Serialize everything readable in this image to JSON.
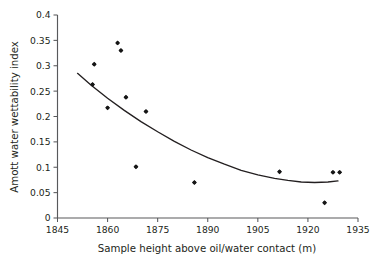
{
  "chart_data": {
    "type": "scatter",
    "title": "",
    "xlabel": "Sample height above oil/water contact (m)",
    "ylabel": "Amott water wettability index",
    "xlim": [
      1845,
      1935
    ],
    "ylim": [
      0,
      0.4
    ],
    "xticks": [
      1845,
      1860,
      1875,
      1890,
      1905,
      1920,
      1935
    ],
    "xtick_labels": [
      "1845",
      "1860",
      "1875",
      "1890",
      "1905",
      "1920",
      "1935"
    ],
    "yticks": [
      0,
      0.05,
      0.1,
      0.15,
      0.2,
      0.25,
      0.3,
      0.35,
      0.4
    ],
    "ytick_labels": [
      "0",
      "0.05",
      "0.1",
      "0.15",
      "0.2",
      "0.25",
      "0.3",
      "0.35",
      "0.4"
    ],
    "grid": false,
    "legend": null,
    "marker": "filled-diamond",
    "marker_color": "#161616",
    "points": [
      {
        "x": 1856.0,
        "y": 0.303
      },
      {
        "x": 1855.5,
        "y": 0.263
      },
      {
        "x": 1863.0,
        "y": 0.345
      },
      {
        "x": 1864.0,
        "y": 0.33
      },
      {
        "x": 1860.0,
        "y": 0.217
      },
      {
        "x": 1865.5,
        "y": 0.238
      },
      {
        "x": 1871.5,
        "y": 0.21
      },
      {
        "x": 1868.5,
        "y": 0.101
      },
      {
        "x": 1886.0,
        "y": 0.07
      },
      {
        "x": 1911.5,
        "y": 0.091
      },
      {
        "x": 1925.0,
        "y": 0.03
      },
      {
        "x": 1927.5,
        "y": 0.09
      },
      {
        "x": 1929.5,
        "y": 0.09
      }
    ],
    "series": [
      {
        "name": "Amott index data",
        "x": [
          1856.0,
          1855.5,
          1863.0,
          1864.0,
          1860.0,
          1865.5,
          1871.5,
          1868.5,
          1886.0,
          1911.5,
          1925.0,
          1927.5,
          1929.5
        ],
        "values": [
          0.303,
          0.263,
          0.345,
          0.33,
          0.217,
          0.238,
          0.21,
          0.101,
          0.07,
          0.091,
          0.03,
          0.09,
          0.09
        ]
      }
    ],
    "trendline": {
      "name": "polynomial-fit",
      "color": "#231f20",
      "x": [
        1851,
        1855,
        1860,
        1865,
        1870,
        1875,
        1880,
        1885,
        1890,
        1895,
        1900,
        1905,
        1910,
        1914,
        1918,
        1922,
        1926,
        1929
      ],
      "y": [
        0.285,
        0.262,
        0.236,
        0.212,
        0.19,
        0.17,
        0.151,
        0.134,
        0.119,
        0.106,
        0.094,
        0.085,
        0.078,
        0.074,
        0.071,
        0.07,
        0.071,
        0.073
      ]
    }
  }
}
